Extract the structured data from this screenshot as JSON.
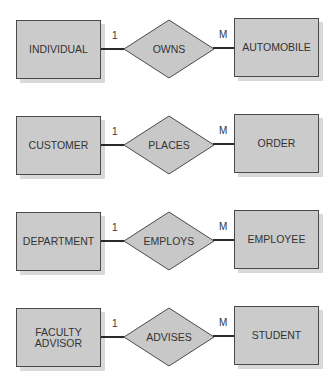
{
  "diagram": {
    "type": "entity-relationship",
    "relationships": [
      {
        "left_entity": "INDIVIDUAL",
        "relationship": "OWNS",
        "right_entity": "AUTOMOBILE",
        "left_cardinality": "1",
        "right_cardinality": "M"
      },
      {
        "left_entity": "CUSTOMER",
        "relationship": "PLACES",
        "right_entity": "ORDER",
        "left_cardinality": "1",
        "right_cardinality": "M"
      },
      {
        "left_entity": "DEPARTMENT",
        "relationship": "EMPLOYS",
        "right_entity": "EMPLOYEE",
        "left_cardinality": "1",
        "right_cardinality": "M"
      },
      {
        "left_entity": "FACULTY ADVISOR",
        "relationship": "ADVISES",
        "right_entity": "STUDENT",
        "left_cardinality": "1",
        "right_cardinality": "M"
      }
    ],
    "colors": {
      "entity_fill": "#cbcbcb",
      "relationship_fill": "#c8c8c8",
      "line": "#2a2a2a"
    }
  }
}
